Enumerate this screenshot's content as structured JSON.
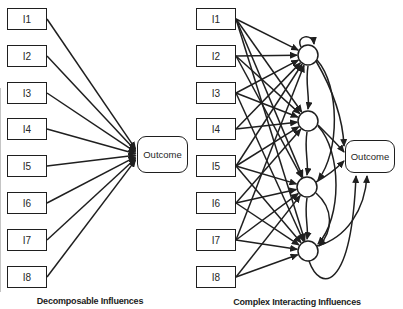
{
  "figure": {
    "background": "#ffffff",
    "stroke_color": "#1f1f1f",
    "text_color": "#262626",
    "left_panel": {
      "caption": "Decomposable Influences",
      "inputs": [
        "I1",
        "I2",
        "I3",
        "I4",
        "I5",
        "I6",
        "I7",
        "I8"
      ],
      "outcome_label": "Outcome"
    },
    "right_panel": {
      "caption": "Complex Interacting Influences",
      "inputs": [
        "I1",
        "I2",
        "I3",
        "I4",
        "I5",
        "I6",
        "I7",
        "I8"
      ],
      "outcome_label": "Outcome",
      "hidden_node_count": 4
    },
    "diagram": {
      "type": "node-link",
      "left": {
        "input_x": 7,
        "input_w": 40,
        "input_h": 22,
        "input_tops": [
          8,
          45,
          82,
          118,
          155,
          192,
          229,
          266
        ],
        "outcome": {
          "x": 137,
          "y": 136,
          "w": 51,
          "h": 37
        },
        "edges_to_outcome": [
          "I1",
          "I2",
          "I3",
          "I4",
          "I5",
          "I6",
          "I7",
          "I8"
        ],
        "converge_x": 135.5,
        "converge_center_y": 154.5,
        "converge_spread": 1.6
      },
      "right": {
        "input_x": 196,
        "input_w": 40,
        "input_h": 22,
        "input_tops": [
          8,
          45,
          82,
          118,
          155,
          192,
          229,
          266
        ],
        "hidden_centers": [
          [
            308,
            55
          ],
          [
            308,
            121
          ],
          [
            307,
            187
          ],
          [
            308,
            251
          ]
        ],
        "hidden_r": 10,
        "outcome": {
          "x": 345,
          "y": 140,
          "w": 50,
          "h": 33
        },
        "input_to_hidden": [
          [
            0,
            0
          ],
          [
            0,
            1
          ],
          [
            0,
            2
          ],
          [
            0,
            3
          ],
          [
            1,
            0
          ],
          [
            1,
            1
          ],
          [
            1,
            2
          ],
          [
            2,
            0
          ],
          [
            2,
            1
          ],
          [
            2,
            3
          ],
          [
            3,
            0
          ],
          [
            3,
            1
          ],
          [
            4,
            0
          ],
          [
            4,
            1
          ],
          [
            4,
            2
          ],
          [
            4,
            3
          ],
          [
            5,
            1
          ],
          [
            5,
            2
          ],
          [
            5,
            3
          ],
          [
            6,
            0
          ],
          [
            6,
            2
          ],
          [
            6,
            3
          ],
          [
            7,
            2
          ],
          [
            7,
            3
          ]
        ],
        "hidden_curves": [
          {
            "name": "h1-self-loop",
            "d": "M 301 47 C 295 35, 313 33, 314 44"
          },
          {
            "name": "h1-to-h2",
            "d": "M 308 66 C 305 84, 310 97, 308 109"
          },
          {
            "name": "h2-to-h3",
            "d": "M 307 132 C 304 150, 309 163, 307 175"
          },
          {
            "name": "h3-to-h4",
            "d": "M 307 198 C 304 216, 309 228, 307 239"
          },
          {
            "name": "h1-to-h3-arc",
            "d": "M 317 60 C 340 86, 340 152, 318 180"
          },
          {
            "name": "h2-to-h4-arc",
            "d": "M 318 126 C 342 152, 342 218, 318 244"
          },
          {
            "name": "h3-to-h4-arc",
            "d": "M 316 193 C 334 209, 333 231, 319 246"
          },
          {
            "name": "h1-to-outcome",
            "d": "M 316 61 C 334 92, 343 122, 344 146"
          },
          {
            "name": "h2-to-outcome",
            "d": "M 318 125 C 332 139, 340 147, 344 152"
          },
          {
            "name": "h3-to-outcome",
            "d": "M 316 182 C 327 176, 337 168, 344 161"
          },
          {
            "name": "h4-to-outcome-inner",
            "d": "M 317 246 C 347 238, 365 209, 367 176"
          },
          {
            "name": "h4-to-outcome-outer",
            "d": "M 309 261 C 320 292, 351 293, 356 176"
          }
        ]
      }
    }
  }
}
